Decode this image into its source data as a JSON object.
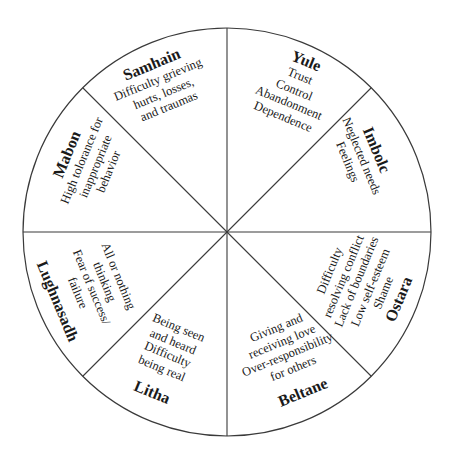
{
  "diagram": {
    "type": "wheel",
    "sector_count": 8,
    "line_color": "#3a3a3a",
    "text_color": "#1a1a1a",
    "sectors": [
      {
        "name": "Samhain",
        "lines": [
          "Difficulty grieving",
          "hurts, losses,",
          "and traumas"
        ]
      },
      {
        "name": "Yule",
        "lines": [
          "Trust",
          "Control",
          "Abandonment",
          "Dependence"
        ]
      },
      {
        "name": "Imbolc",
        "lines": [
          "Neglected needs",
          "Feelings"
        ]
      },
      {
        "name": "Ostara",
        "lines": [
          "Difficulty",
          "resolving conflict",
          "Lack of boundaries",
          "Low self-esteem",
          "Shame"
        ]
      },
      {
        "name": "Beltane",
        "lines": [
          "Giving and",
          "receiving love",
          "Over-responsibility",
          "for others"
        ]
      },
      {
        "name": "Litha",
        "lines": [
          "Being seen",
          "and heard",
          "Difficulty",
          "being real"
        ]
      },
      {
        "name": "Lughnasadh",
        "lines": [
          "All or nothing",
          "thinking",
          "Fear of success/",
          "failure"
        ]
      },
      {
        "name": "Mabon",
        "lines": [
          "High tolorance for",
          "inappropriate",
          "behavior"
        ]
      }
    ]
  }
}
